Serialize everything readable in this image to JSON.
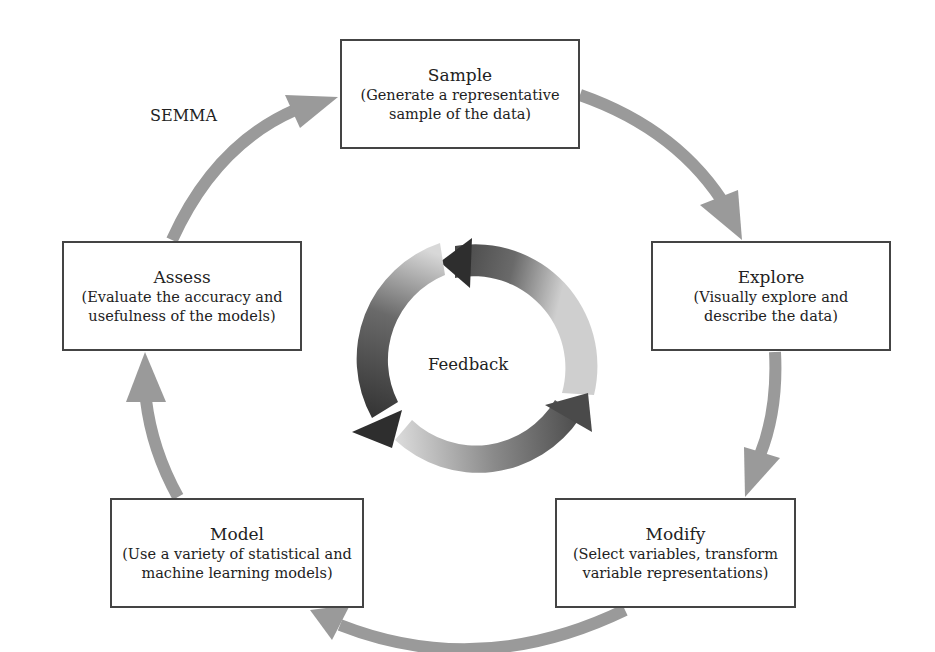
{
  "diagram": {
    "label": "SEMMA",
    "center_label": "Feedback",
    "stages": [
      {
        "id": "sample",
        "title": "Sample",
        "description_line1": "(Generate a representative",
        "description_line2": "sample of the data)"
      },
      {
        "id": "explore",
        "title": "Explore",
        "description_line1": "(Visually explore and",
        "description_line2": "describe the data)"
      },
      {
        "id": "modify",
        "title": "Modify",
        "description_line1": "(Select variables, transform",
        "description_line2": "variable representations)"
      },
      {
        "id": "model",
        "title": "Model",
        "description_line1": "(Use a variety of statistical and",
        "description_line2": "machine learning models)"
      },
      {
        "id": "assess",
        "title": "Assess",
        "description_line1": "(Evaluate the accuracy and",
        "description_line2": "usefulness of the models)"
      }
    ],
    "flow": [
      "Sample",
      "Explore",
      "Modify",
      "Model",
      "Assess",
      "Sample"
    ],
    "colors": {
      "cycle_arrow": "#9a9a9a",
      "box_border": "#444444",
      "feedback_dark": "#2e2e2e",
      "feedback_light": "#d6d6d6",
      "text": "#222222"
    }
  }
}
